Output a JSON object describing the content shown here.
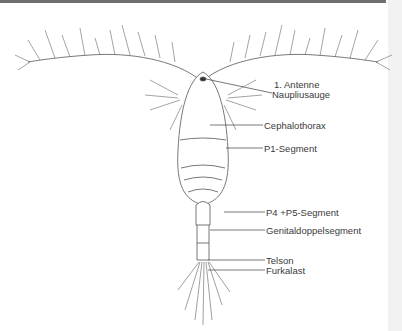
{
  "figure": {
    "labels": [
      {
        "id": "antenne",
        "text": "1. Antenne"
      },
      {
        "id": "naupliusauge",
        "text": "Naupliusauge"
      },
      {
        "id": "cephalothorax",
        "text": "Cephalothorax"
      },
      {
        "id": "p1",
        "text": "P1-Segment"
      },
      {
        "id": "p4p5",
        "text": "P4 +P5-Segment"
      },
      {
        "id": "genital",
        "text": "Genitaldoppelsegment"
      },
      {
        "id": "telson",
        "text": "Telson"
      },
      {
        "id": "furka",
        "text": "Furkalast"
      }
    ],
    "colors": {
      "line": "#555555",
      "text": "#3a3a3a",
      "topbar": "#6e6e6e",
      "edge": "#f2f2f2"
    }
  }
}
